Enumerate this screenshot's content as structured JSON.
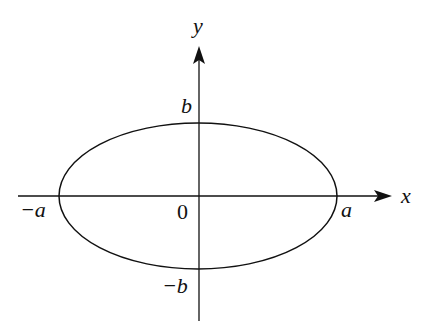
{
  "diagram": {
    "type": "ellipse-on-axes",
    "colors": {
      "stroke": "#111111",
      "background": "#ffffff"
    },
    "axes": {
      "x_label": "x",
      "y_label": "y",
      "origin_label": "0"
    },
    "ellipse": {
      "center": [
        0,
        0
      ],
      "semi_major_label": "a",
      "semi_minor_label": "b"
    },
    "intercepts": {
      "x_pos": "a",
      "x_neg": "−a",
      "y_pos": "b",
      "y_neg": "−b"
    }
  }
}
